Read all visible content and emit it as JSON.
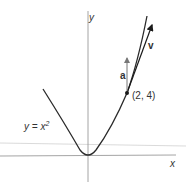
{
  "diagram": {
    "curve_label": "y = x",
    "curve_label_exponent": "2",
    "point_label": "(2, 4)",
    "velocity_label": "v",
    "acceleration_label": "a",
    "x_axis_label": "x",
    "y_axis_label": "y",
    "colors": {
      "curve": "#2a2a2a",
      "axis": "#9a9a9a",
      "velocity": "#1a1a1a",
      "acceleration": "#777777",
      "horizon_line": "#d0d0d0"
    }
  }
}
